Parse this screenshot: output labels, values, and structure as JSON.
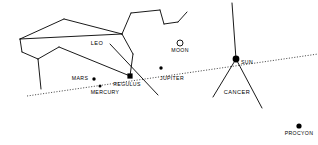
{
  "chart_data": {
    "type": "scatter",
    "title": "",
    "subtitle": "",
    "xlabel": "",
    "ylabel": "",
    "grid": false,
    "legend": "none",
    "background_color": "#ffffff",
    "line_color": "#000000",
    "objects": [
      {
        "name": "LEO",
        "kind": "constellation",
        "marker": "none",
        "x": 97,
        "y": 43,
        "label_x": 97,
        "label_y": 41
      },
      {
        "name": "MOON",
        "kind": "moon",
        "marker": "open-circle",
        "x": 180,
        "y": 43,
        "label_x": 180,
        "label_y": 48,
        "radius": 3.0
      },
      {
        "name": "SUN",
        "kind": "sun",
        "marker": "filled-dot",
        "x": 236,
        "y": 59,
        "label_x": 247,
        "label_y": 60,
        "radius": 3.4
      },
      {
        "name": "JUPITER",
        "kind": "planet",
        "marker": "filled-dot",
        "x": 161,
        "y": 68,
        "label_x": 172,
        "label_y": 76,
        "radius": 1.7
      },
      {
        "name": "MARS",
        "kind": "planet",
        "marker": "filled-dot",
        "x": 94,
        "y": 79,
        "label_x": 80,
        "label_y": 76,
        "radius": 1.7
      },
      {
        "name": "MERCURY",
        "kind": "planet",
        "marker": "filled-dot",
        "x": 100,
        "y": 86,
        "label_x": 105,
        "label_y": 90,
        "radius": 1.5
      },
      {
        "name": "REGULUS",
        "kind": "star",
        "marker": "filled-square",
        "x": 130,
        "y": 76,
        "label_x": 127,
        "label_y": 82,
        "radius": 2.6
      },
      {
        "name": "CANCER",
        "kind": "constellation",
        "marker": "none",
        "x": 237,
        "y": 92,
        "label_x": 237,
        "label_y": 90
      },
      {
        "name": "PROCYON",
        "kind": "star",
        "marker": "filled-dot",
        "x": 299,
        "y": 126,
        "label_x": 299,
        "label_y": 131,
        "radius": 2.6
      }
    ],
    "ecliptic": {
      "name": "ecliptic",
      "style": "dotted",
      "from": [
        27,
        96
      ],
      "to": [
        318,
        54
      ]
    },
    "constellation_lines": {
      "leo": [
        [
          [
            20,
            39
          ],
          [
            64,
            19
          ]
        ],
        [
          [
            64,
            19
          ],
          [
            122,
            34
          ]
        ],
        [
          [
            122,
            34
          ],
          [
            20,
            39
          ]
        ],
        [
          [
            20,
            39
          ],
          [
            22,
            52
          ]
        ],
        [
          [
            22,
            52
          ],
          [
            38,
            59
          ]
        ],
        [
          [
            38,
            59
          ],
          [
            41,
            89
          ]
        ],
        [
          [
            38,
            59
          ],
          [
            59,
            47
          ]
        ],
        [
          [
            59,
            47
          ],
          [
            130,
            76
          ]
        ],
        [
          [
            122,
            34
          ],
          [
            131,
            13
          ]
        ],
        [
          [
            131,
            13
          ],
          [
            160,
            10
          ]
        ],
        [
          [
            160,
            10
          ],
          [
            164,
            24
          ]
        ],
        [
          [
            164,
            24
          ],
          [
            178,
            22
          ]
        ],
        [
          [
            178,
            22
          ],
          [
            187,
            12
          ]
        ],
        [
          [
            122,
            34
          ],
          [
            133,
            54
          ]
        ],
        [
          [
            133,
            54
          ],
          [
            130,
            76
          ]
        ]
      ],
      "cancer": [
        [
          [
            232,
            3
          ],
          [
            236,
            59
          ]
        ],
        [
          [
            236,
            59
          ],
          [
            213,
            97
          ]
        ],
        [
          [
            236,
            59
          ],
          [
            262,
            108
          ]
        ]
      ],
      "crossing": [
        [
          [
            110,
            44
          ],
          [
            158,
            95
          ]
        ]
      ]
    }
  }
}
